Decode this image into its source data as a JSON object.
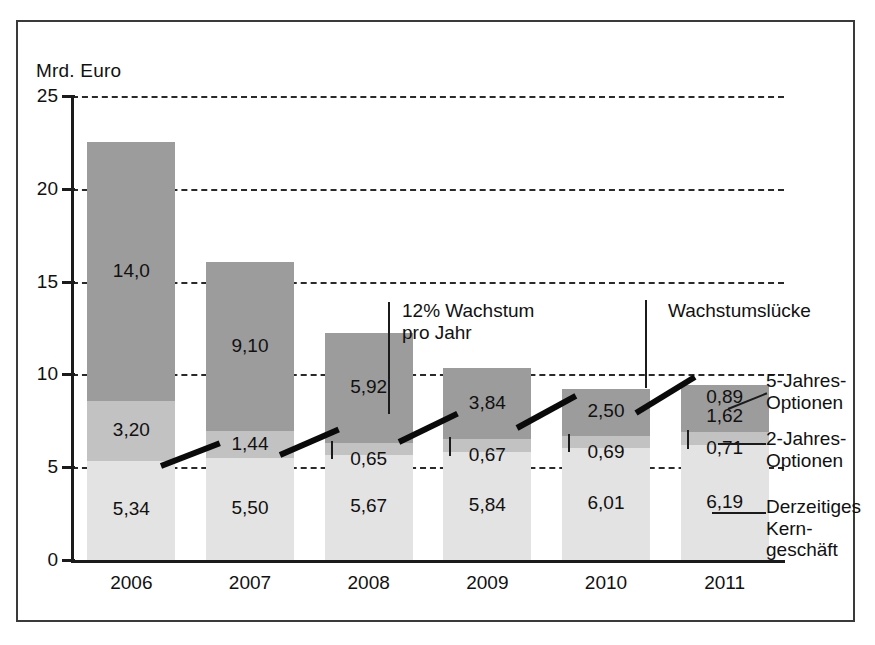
{
  "figure": {
    "unit_label": "Mrd. Euro",
    "frame": true
  },
  "chart_data": {
    "type": "bar",
    "stacked": true,
    "title": "",
    "subtitle": "",
    "xlabel": "",
    "ylabel": "Mrd. Euro",
    "ylim": [
      0,
      25
    ],
    "yticks": [
      0,
      5,
      10,
      15,
      20,
      25
    ],
    "ytick_labels": [
      "0",
      "5",
      "10",
      "15",
      "20",
      "25"
    ],
    "grid": "horizontal-dashed",
    "legend_position": "right",
    "categories": [
      "2006",
      "2007",
      "2008",
      "2009",
      "2010",
      "2011"
    ],
    "series": [
      {
        "name": "Derzeitiges Kerngeschäft",
        "values": [
          5.34,
          5.5,
          5.67,
          5.84,
          6.01,
          6.19
        ],
        "labels": [
          "5,34",
          "5,50",
          "5,67",
          "5,84",
          "6,01",
          "6,19"
        ],
        "color": "#e3e3e3"
      },
      {
        "name": "2-Jahres-Optionen",
        "values": [
          3.2,
          1.44,
          0.65,
          0.67,
          0.69,
          0.71
        ],
        "labels": [
          "3,20",
          "1,44",
          "0,65",
          "0,67",
          "0,69",
          "0,71"
        ],
        "color": "#c2c2c2"
      },
      {
        "name": "5-Jahres-Optionen",
        "values": [
          14.0,
          9.1,
          5.92,
          3.84,
          2.5,
          1.62
        ],
        "labels": [
          "14,0",
          "9,10",
          "5,92",
          "3,84",
          "2,50",
          "1,62"
        ],
        "color": "#9c9c9c"
      },
      {
        "name": "Wachstumslücke",
        "values": [
          0,
          0,
          0,
          0,
          0,
          0.89
        ],
        "labels": [
          "",
          "",
          "",
          "",
          "",
          "0,89"
        ],
        "color": "#9c9c9c"
      }
    ],
    "totals": [
      22.54,
      16.04,
      12.24,
      10.35,
      9.2,
      9.41
    ],
    "trend_line": {
      "name": "12% Wachstum pro Jahr",
      "values": [
        5.34,
        5.98,
        6.7,
        7.5,
        8.4,
        9.41
      ],
      "color": "#0a0a0a"
    },
    "annotations": [
      {
        "text": "12% Wachstum\npro Jahr"
      },
      {
        "text": "Wachstumslücke"
      }
    ]
  },
  "legend": {
    "items": [
      {
        "label": "5-Jahres-\nOptionen"
      },
      {
        "label": "2-Jahres-\nOptionen"
      },
      {
        "label": "Derzeitiges\nKern-\ngeschäft"
      }
    ]
  },
  "colors": {
    "core": "#e3e3e3",
    "opt2": "#c2c2c2",
    "opt5": "#9c9c9c",
    "line": "#0a0a0a",
    "axis": "#1b1b1b",
    "frame": "#3a3a3a"
  }
}
